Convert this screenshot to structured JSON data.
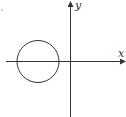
{
  "diagram": {
    "type": "coordinate-plane",
    "axes": {
      "x_label": "x",
      "y_label": "y"
    },
    "shapes": [
      {
        "type": "circle",
        "description": "circle centered on negative x-axis, left of origin, not touching y-axis"
      }
    ],
    "colors": {
      "stroke": "#333333",
      "background": "#ffffff"
    }
  }
}
